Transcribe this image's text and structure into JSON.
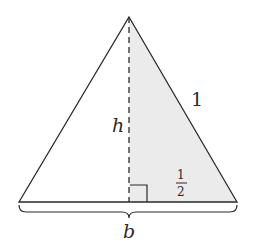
{
  "diagram": {
    "type": "geometry",
    "colors": {
      "stroke": "#2a2a2a",
      "shade": "#ebebeb",
      "background": "#ffffff"
    },
    "vertices": {
      "apex": [
        129,
        17
      ],
      "base_left": [
        19,
        202
      ],
      "base_right": [
        237,
        202
      ],
      "foot": [
        129,
        202
      ]
    },
    "labels": {
      "height": "h",
      "side": "1",
      "half_base_num": "1",
      "half_base_den": "2",
      "base": "b"
    }
  }
}
